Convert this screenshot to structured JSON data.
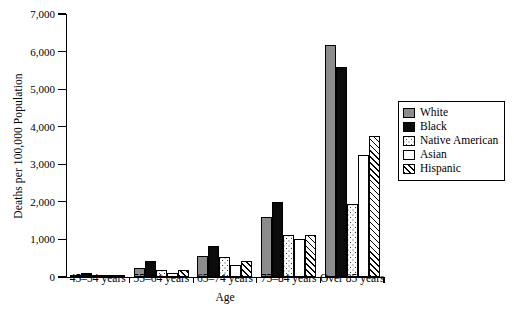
{
  "chart_data": {
    "type": "bar",
    "title": "",
    "xlabel": "Age",
    "ylabel": "Deaths per 100,000 Population",
    "ylim": [
      0,
      7000
    ],
    "yticks": [
      0,
      1000,
      2000,
      3000,
      4000,
      5000,
      6000,
      7000
    ],
    "ytick_labels": [
      "0",
      "1,000",
      "2,000",
      "3,000",
      "4,000",
      "5,000",
      "6,000",
      "7,000"
    ],
    "grid": false,
    "legend_position": "right",
    "categories": [
      "45–54 years",
      "55–64 years",
      "65–74 years",
      "75–84 years",
      "Over 85 years"
    ],
    "series": [
      {
        "name": "White",
        "pattern": "solid-gray",
        "color": "#8c8c8c",
        "values": [
          60,
          250,
          560,
          1600,
          6180
        ]
      },
      {
        "name": "Black",
        "pattern": "solid-black",
        "color": "#0b0b0b",
        "values": [
          120,
          420,
          830,
          2000,
          5600
        ]
      },
      {
        "name": "Native American",
        "pattern": "dotted",
        "color": "#ffffff",
        "values": [
          55,
          190,
          530,
          1130,
          1950
        ]
      },
      {
        "name": "Asian",
        "pattern": "empty",
        "color": "#ffffff",
        "values": [
          30,
          110,
          330,
          1000,
          3250
        ]
      },
      {
        "name": "Hispanic",
        "pattern": "diagonal",
        "color": "#ffffff",
        "values": [
          60,
          175,
          420,
          1130,
          3750
        ]
      }
    ]
  },
  "legend": {
    "items": [
      {
        "label": "White"
      },
      {
        "label": "Black"
      },
      {
        "label": "Native American"
      },
      {
        "label": "Asian"
      },
      {
        "label": "Hispanic"
      }
    ]
  }
}
